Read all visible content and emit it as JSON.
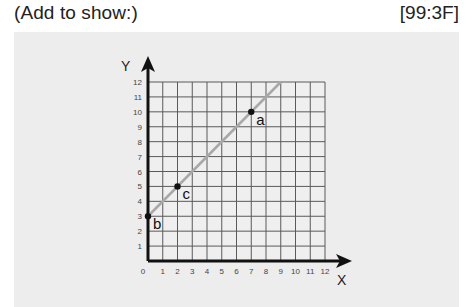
{
  "header": {
    "instruction": "(Add to show:)",
    "code": "[99:3F]"
  },
  "chart_data": {
    "type": "line",
    "title": "",
    "xlabel": "X",
    "ylabel": "Y",
    "xlim": [
      0,
      12
    ],
    "ylim": [
      0,
      12
    ],
    "grid": true,
    "x_ticks": [
      "0",
      "1",
      "2",
      "3",
      "4",
      "5",
      "6",
      "7",
      "8",
      "9",
      "10",
      "11",
      "12"
    ],
    "y_ticks": [
      "1",
      "2",
      "3",
      "4",
      "5",
      "6",
      "7",
      "8",
      "9",
      "10",
      "11",
      "12"
    ],
    "line": {
      "equation": "y = x + 3",
      "x": [
        0,
        9
      ],
      "y": [
        3,
        12
      ],
      "color": "#a8a8a8"
    },
    "points": [
      {
        "label": "a",
        "x": 7,
        "y": 10
      },
      {
        "label": "b",
        "x": 0,
        "y": 3
      },
      {
        "label": "c",
        "x": 2,
        "y": 5
      }
    ]
  }
}
